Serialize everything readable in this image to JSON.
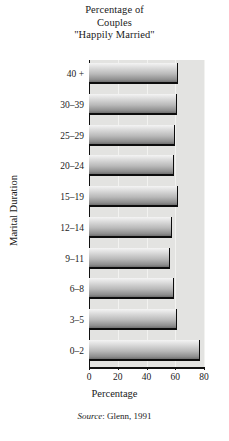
{
  "title": {
    "line1": "Percentage of",
    "line2": "Couples",
    "line3": "\"Happily Married\""
  },
  "source": {
    "label": "Source",
    "separator": ":",
    "text": "Glenn, 1991"
  },
  "chart_data": {
    "type": "bar",
    "orientation": "horizontal",
    "title": "Percentage of Couples \"Happily Married\"",
    "xlabel": "Percentage",
    "ylabel": "Marital Duration",
    "categories": [
      "40 +",
      "30–39",
      "25–29",
      "20–24",
      "15–19",
      "12–14",
      "9–11",
      "6–8",
      "3–5",
      "0–2"
    ],
    "values": [
      62,
      61,
      60,
      59,
      62,
      58,
      56,
      59,
      61,
      77
    ],
    "xlim": [
      0,
      80
    ],
    "xticks": [
      0,
      20,
      40,
      60,
      80
    ],
    "xticklabels": [
      "0",
      "20",
      "40",
      "60",
      "80"
    ],
    "grid": true,
    "legend": false,
    "bar_color": "#b9b9b9",
    "plot_background": "#e3e3e1"
  }
}
